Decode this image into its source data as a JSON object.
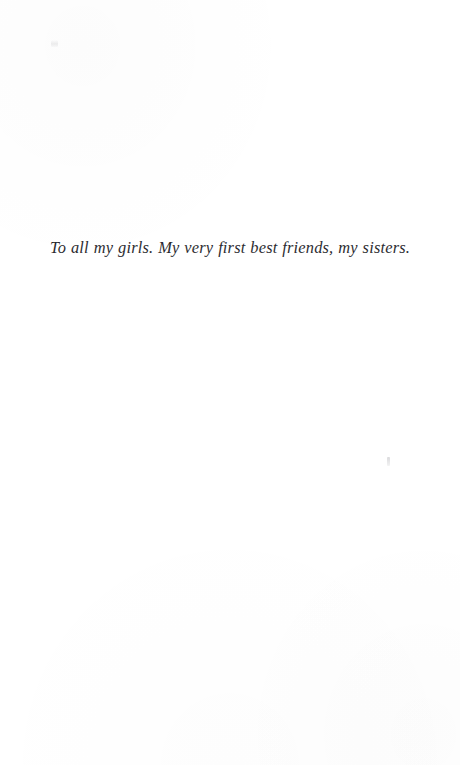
{
  "page": {
    "type": "book-dedication-page",
    "background_color": "#ffffff",
    "width": 460,
    "height": 765
  },
  "dedication": {
    "text": "To all my girls. My very first best friends, my sisters.",
    "style": "italic",
    "alignment": "center",
    "text_color": "#1b1b1f"
  },
  "artifacts": {
    "top_left_speck": {
      "name": "scan-speck",
      "color": "#96969b"
    },
    "right_speck": {
      "name": "scan-speck",
      "color": "#787880"
    }
  }
}
